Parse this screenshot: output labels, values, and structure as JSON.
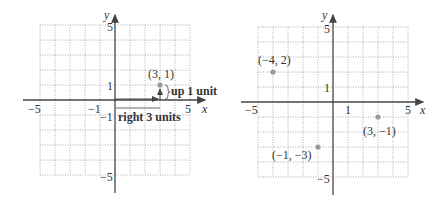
{
  "figures": [
    {
      "id": "left",
      "axis_x_label": "x",
      "axis_y_label": "y",
      "tick_labels": {
        "x_neg5": "−5",
        "x_neg1": "−1",
        "x_pos5": "5",
        "y_pos5": "5",
        "y_pos1": "1",
        "y_neg1": "−1",
        "y_neg5": "−5"
      },
      "point": {
        "label": "(3, 1)",
        "x": 3,
        "y": 1
      },
      "annotations": {
        "horizontal": "right 3 units",
        "vertical": "up 1 unit"
      }
    },
    {
      "id": "right",
      "axis_x_label": "x",
      "axis_y_label": "y",
      "tick_labels": {
        "x_neg5": "−5",
        "x_pos1": "1",
        "x_pos5": "5",
        "y_pos5": "5",
        "y_pos1": "1",
        "y_neg5": "−5"
      },
      "points": [
        {
          "label": "(−4, 2)",
          "x": -4,
          "y": 2
        },
        {
          "label": "(3, −1)",
          "x": 3,
          "y": -1
        },
        {
          "label": "(−1, −3)",
          "x": -1,
          "y": -3
        }
      ]
    }
  ],
  "colors": {
    "axis": "#444444",
    "grid": "#9a9a9a",
    "point": "#999999",
    "text": "#333333"
  }
}
